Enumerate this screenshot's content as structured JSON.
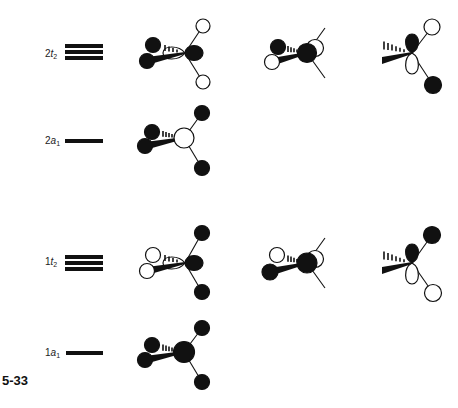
{
  "figure": {
    "number": "5-33"
  },
  "colors": {
    "filled": "#111111",
    "open": "#ffffff",
    "line": "#111111"
  },
  "levels": [
    {
      "id": "2t2",
      "num": "2",
      "sym": "t",
      "sub": "2",
      "degeneracy": 3,
      "orbitals": [
        {
          "c_left": "#ffffff",
          "c_right": "#111111",
          "h_top": "#ffffff",
          "h_bottom": "#ffffff",
          "h_back": "#111111",
          "h_front": "#111111"
        },
        {
          "c_front": "#111111",
          "c_back": "#ffffff",
          "h_back": "#111111",
          "h_front": "#ffffff"
        },
        {
          "c_up": "#111111",
          "c_down": "#ffffff",
          "h_top": "#ffffff",
          "h_bottom": "#111111"
        }
      ]
    },
    {
      "id": "2a1",
      "num": "2",
      "sym": "a",
      "sub": "1",
      "degeneracy": 1,
      "orbitals": [
        {
          "c": "#ffffff",
          "h_top": "#111111",
          "h_bottom": "#111111",
          "h_back": "#111111",
          "h_front": "#111111"
        }
      ]
    },
    {
      "id": "1t2",
      "num": "1",
      "sym": "t",
      "sub": "2",
      "degeneracy": 3,
      "orbitals": [
        {
          "c_left": "#ffffff",
          "c_right": "#111111",
          "h_top": "#111111",
          "h_bottom": "#111111",
          "h_back": "#ffffff",
          "h_front": "#ffffff"
        },
        {
          "c_front": "#111111",
          "c_back": "#ffffff",
          "h_back": "#ffffff",
          "h_front": "#111111"
        },
        {
          "c_up": "#111111",
          "c_down": "#ffffff",
          "h_top": "#111111",
          "h_bottom": "#ffffff"
        }
      ]
    },
    {
      "id": "1a1",
      "num": "1",
      "sym": "a",
      "sub": "1",
      "degeneracy": 1,
      "orbitals": [
        {
          "c": "#111111",
          "h_top": "#111111",
          "h_bottom": "#111111",
          "h_back": "#111111",
          "h_front": "#111111"
        }
      ]
    }
  ]
}
